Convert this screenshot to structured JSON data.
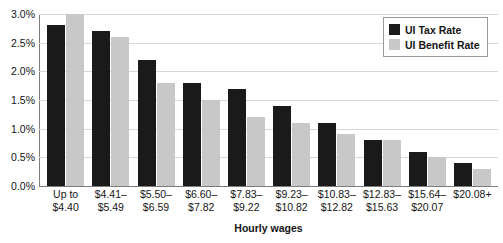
{
  "chart_data": {
    "type": "bar",
    "title": "",
    "xlabel": "Hourly wages",
    "ylabel": "",
    "ylim": [
      0,
      3.0
    ],
    "ytick_labels": [
      "3.0%",
      "2.5%",
      "2.0%",
      "1.5%",
      "1.0%",
      "0.5%",
      "0.0%"
    ],
    "ytick_values": [
      3.0,
      2.5,
      2.0,
      1.5,
      1.0,
      0.5,
      0.0
    ],
    "grid": true,
    "legend_position": "top-right",
    "units": "percent",
    "categories": [
      "Up to\n$4.40",
      "$4.41–\n$5.49",
      "$5.50–\n$6.59",
      "$6.60–\n$7.82",
      "$7.83–\n$9.22",
      "$9.23–\n$10.82",
      "$10.83–\n$12.82",
      "$12.83–\n$15.63",
      "$15.64–\n$20.07",
      "$20.08+"
    ],
    "series": [
      {
        "name": "UI Tax Rate",
        "color": "#1a1a1a",
        "values": [
          2.8,
          2.7,
          2.2,
          1.8,
          1.7,
          1.4,
          1.1,
          0.8,
          0.6,
          0.4
        ]
      },
      {
        "name": "UI Benefit Rate",
        "color": "#c8c8c8",
        "values": [
          3.0,
          2.6,
          1.8,
          1.5,
          1.2,
          1.1,
          0.9,
          0.8,
          0.5,
          0.3
        ]
      }
    ]
  },
  "legend": {
    "items": [
      {
        "label": "UI Tax Rate",
        "swatch": "tax"
      },
      {
        "label": "UI Benefit Rate",
        "swatch": "benefit"
      }
    ]
  },
  "colors": {
    "tax": "#1a1a1a",
    "benefit": "#c8c8c8",
    "gridline": "#d6d6d6",
    "axis": "#7d7d7d",
    "text": "#141414",
    "background": "#ffffff"
  }
}
